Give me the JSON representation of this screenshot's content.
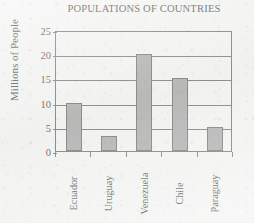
{
  "chart_data": {
    "type": "bar",
    "title": "POPULATIONS OF COUNTRIES",
    "xlabel": "",
    "ylabel": "Millions of People",
    "categories": [
      "Ecuador",
      "Uruguay",
      "Venezuela",
      "Chile",
      "Paraguay"
    ],
    "values": [
      10,
      3,
      20,
      15,
      5
    ],
    "ylim": [
      0,
      25
    ],
    "yticks": [
      0,
      5,
      10,
      15,
      20,
      25
    ],
    "ytick_labels": [
      "0",
      "5",
      "10",
      "15",
      "20",
      "25"
    ],
    "grid": true,
    "legend": false,
    "legend_position": "none",
    "bar_color": "#9b9b9b",
    "bar_edge_color": "#545454",
    "axis_color": "#555555",
    "background_color": "#f4f4f3",
    "text_color": "#1e1e1e"
  }
}
